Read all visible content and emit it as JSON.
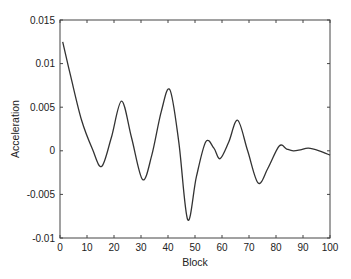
{
  "chart_data": {
    "type": "line",
    "title": "",
    "xlabel": "Block",
    "ylabel": "Acceleration",
    "xlim": [
      0,
      100
    ],
    "ylim": [
      -0.01,
      0.015
    ],
    "grid": false,
    "legend": null,
    "x_ticks": [
      "0",
      "10",
      "20",
      "30",
      "40",
      "50",
      "60",
      "70",
      "80",
      "90",
      "100"
    ],
    "y_ticks": [
      "-0.01",
      "-0.005",
      "0",
      "0.005",
      "0.01",
      "0.015"
    ],
    "series": [
      {
        "name": "Acceleration",
        "color": "#333333",
        "x": [
          1,
          4,
          8,
          12,
          15.4,
          19,
          22.8,
          26.5,
          30.6,
          34,
          37.5,
          40.7,
          44,
          47.3,
          50.5,
          54,
          57,
          59.3,
          62.5,
          65.8,
          69.5,
          73.4,
          77,
          81.2,
          84,
          86.4,
          89,
          92,
          96,
          100
        ],
        "values": [
          0.0125,
          0.0085,
          0.0035,
          0.0002,
          -0.0018,
          0.0015,
          0.0057,
          0.0015,
          -0.0033,
          -0.0005,
          0.0045,
          0.007,
          0.001,
          -0.0079,
          -0.003,
          0.00104,
          0.0003,
          -0.0009,
          0.001,
          0.0035,
          0.0,
          -0.0037,
          -0.002,
          0.00055,
          0.0002,
          0.0,
          0.0001,
          0.0003,
          0.0,
          -0.0005
        ]
      }
    ]
  }
}
